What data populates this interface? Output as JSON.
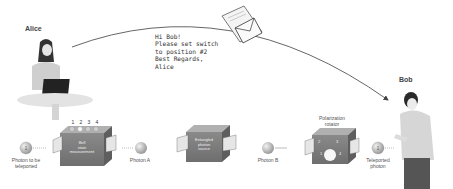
{
  "diagram": {
    "people": {
      "sender": {
        "name": "Alice"
      },
      "receiver": {
        "name": "Bob"
      }
    },
    "message": {
      "lines": [
        "Hi Bob!",
        "Please set switch",
        "to position #2",
        "Best Regards,",
        "Alice"
      ]
    },
    "components": {
      "bsm": {
        "label_lines": [
          "Bell",
          "state",
          "measurement"
        ],
        "switch_numbers": [
          "1",
          "2",
          "3",
          "4"
        ]
      },
      "source": {
        "label_lines": [
          "Entangled",
          "photon",
          "source"
        ]
      },
      "rotator": {
        "title_lines": [
          "Polarization",
          "rotator"
        ],
        "dial_numbers": [
          "2",
          "3",
          "1",
          "4"
        ]
      }
    },
    "photons": {
      "input": {
        "label_lines": [
          "Photon to be",
          "teleported"
        ]
      },
      "a": {
        "label": "Photon A"
      },
      "b": {
        "label": "Photon B"
      },
      "output": {
        "label_lines": [
          "Teleported",
          "photon"
        ]
      }
    },
    "colors": {
      "line": "#555555",
      "box": "#7a7a7a",
      "photon": "#bdbdbd",
      "background": "#ffffff"
    }
  }
}
